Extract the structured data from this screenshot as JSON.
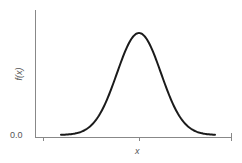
{
  "chart_data": {
    "type": "line",
    "title": "",
    "xlabel": "x",
    "ylabel": "f(x)",
    "ytick_labels": [
      "0.0"
    ],
    "xtick_labels": [],
    "series": [
      {
        "name": "f(x)",
        "distribution": "normal",
        "mean_relative": 0.5,
        "points_px": [
          [
            61,
            134
          ],
          [
            70,
            133
          ],
          [
            80,
            130
          ],
          [
            90,
            123
          ],
          [
            100,
            110
          ],
          [
            110,
            92
          ],
          [
            120,
            65
          ],
          [
            128,
            45
          ],
          [
            134,
            36
          ],
          [
            139,
            33
          ],
          [
            144,
            36
          ],
          [
            150,
            45
          ],
          [
            158,
            65
          ],
          [
            168,
            92
          ],
          [
            178,
            110
          ],
          [
            188,
            123
          ],
          [
            198,
            130
          ],
          [
            208,
            133
          ],
          [
            215,
            134
          ]
        ]
      }
    ],
    "grid": false,
    "legend": null,
    "colors": {
      "curve": "#1a1a1a",
      "axis": "#777777",
      "text": "#555555"
    }
  },
  "labels": {
    "y_axis": "f(x)",
    "x_axis": "x",
    "y_zero": "0.0"
  }
}
